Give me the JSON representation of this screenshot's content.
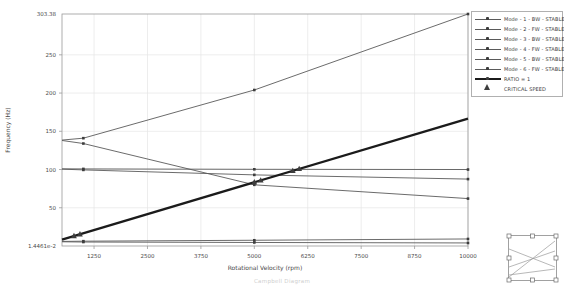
{
  "page": {
    "caption": "Campbell Diagram"
  },
  "chart": {
    "ylabel": "Frequency (Hz)",
    "xlabel": "Rotational Velocity (rpm)",
    "y_max_label": "303.38",
    "y_min_label": "1.4461e-2",
    "colors": {
      "grid": "#e5e5e5",
      "frame": "#9a9a9a",
      "tick_text": "#4a4a4a",
      "axis_text": "#3c3c3c",
      "mode_line": "#5a5a5a",
      "marker": "#3d3d3d",
      "ratio_line": "#1b1b1b",
      "critical": "#3d3d3d"
    }
  },
  "chart_data": {
    "type": "line",
    "title": "",
    "xlabel": "Rotational Velocity (rpm)",
    "ylabel": "Frequency (Hz)",
    "xlim": [
      500,
      10000
    ],
    "ylim": [
      0.014461,
      303.38
    ],
    "x_ticks": [
      1250,
      2500,
      3750,
      5000,
      6250,
      7500,
      8750,
      10000
    ],
    "y_ticks": [
      50,
      100,
      150,
      200,
      250
    ],
    "grid": true,
    "legend_position": "outside-top-right",
    "x": [
      500,
      1000,
      5000,
      10000
    ],
    "marker_x": [
      1000,
      5000,
      10000
    ],
    "series": [
      {
        "name": "Mode - 1 - BW - STABLE",
        "values": [
          5.5,
          5.2,
          4.6,
          4.0
        ]
      },
      {
        "name": "Mode - 2 - FW - STABLE",
        "values": [
          6.0,
          6.3,
          7.5,
          9.2
        ]
      },
      {
        "name": "Mode - 3 - BW - STABLE",
        "values": [
          100.5,
          99.5,
          93.0,
          87.5
        ]
      },
      {
        "name": "Mode - 4 - FW - STABLE",
        "values": [
          100.9,
          100.8,
          100.3,
          100.0
        ]
      },
      {
        "name": "Mode - 5 - BW - STABLE",
        "values": [
          138.0,
          134.0,
          80.0,
          62.0
        ]
      },
      {
        "name": "Mode - 6 - FW - STABLE",
        "values": [
          138.5,
          141.0,
          204.0,
          303.38
        ]
      }
    ],
    "ratio_line": {
      "name": "RATIO = 1",
      "x": [
        500,
        10000
      ],
      "values": [
        8.33,
        166.67
      ]
    },
    "critical_speeds": {
      "name": "CRITICAL SPEED",
      "points": [
        [
          780,
          13.0
        ],
        [
          920,
          15.3
        ],
        [
          5000,
          83.3
        ],
        [
          5150,
          85.8
        ],
        [
          5900,
          98.3
        ],
        [
          6050,
          100.8
        ]
      ]
    }
  },
  "legend": {
    "items": [
      {
        "label": "Mode - 1 - BW - STABLE",
        "type": "mode"
      },
      {
        "label": "Mode - 2 - FW - STABLE",
        "type": "mode"
      },
      {
        "label": "Mode - 3 - BW - STABLE",
        "type": "mode"
      },
      {
        "label": "Mode - 4 - FW - STABLE",
        "type": "mode"
      },
      {
        "label": "Mode - 5 - BW - STABLE",
        "type": "mode"
      },
      {
        "label": "Mode - 6 - FW - STABLE",
        "type": "mode"
      },
      {
        "label": "RATIO = 1",
        "type": "ratio"
      },
      {
        "label": "CRITICAL SPEED",
        "type": "critical"
      }
    ]
  }
}
